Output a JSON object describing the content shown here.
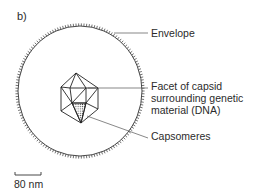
{
  "panel_label": "b)",
  "labels": {
    "envelope": "Envelope",
    "facet_line1": "Facet of capsid",
    "facet_line2": "surrounding genetic",
    "facet_line3": "material (DNA)",
    "capsomeres": "Capsomeres"
  },
  "scale_bar": {
    "label": "80 nm"
  },
  "colors": {
    "line": "#333333",
    "background": "#ffffff"
  }
}
